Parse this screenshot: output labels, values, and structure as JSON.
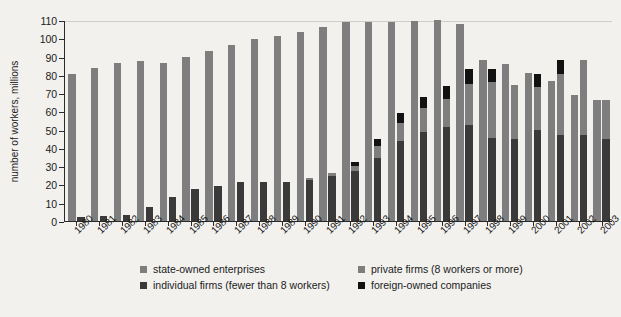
{
  "chart_data": {
    "type": "bar",
    "title": "",
    "xlabel": "",
    "ylabel": "number of workers, millions",
    "ylim": [
      0,
      110
    ],
    "ytick_step": 10,
    "yticks": [
      0,
      10,
      20,
      30,
      40,
      50,
      60,
      70,
      80,
      90,
      100,
      110
    ],
    "grid": false,
    "legend_position": "bottom",
    "stacked": true,
    "grouping": "Each year shows two bars: state-owned enterprises (left) and a stacked bar of individual firms + private firms + foreign-owned companies (right)",
    "categories": [
      "1980",
      "1981",
      "1982",
      "1983",
      "1984",
      "1985",
      "1986",
      "1987",
      "1988",
      "1989",
      "1990",
      "1991",
      "1992",
      "1993",
      "1994",
      "1995",
      "1996",
      "1997",
      "1998",
      "1999",
      "2000",
      "2001",
      "2002",
      "2003"
    ],
    "series": [
      {
        "name": "state-owned enterprises",
        "color": "#7e7e7e",
        "bar": "left",
        "values": [
          80.2,
          83.7,
          86.3,
          87.7,
          86.3,
          89.9,
          93.3,
          96.5,
          99.8,
          101.0,
          103.5,
          106.2,
          108.9,
          108.9,
          108.9,
          109.3,
          109.8,
          107.7,
          88.1,
          85.7,
          81.0,
          76.4,
          69.2,
          66.2
        ]
      },
      {
        "name": "individual firms (fewer than 8 workers)",
        "color": "#3a3a3a",
        "bar": "right",
        "stack_order": 1,
        "values": [
          2.3,
          2.6,
          3.2,
          7.5,
          13.4,
          17.7,
          19.3,
          21.6,
          21.4,
          21.2,
          22.5,
          24.7,
          27.4,
          34.3,
          43.6,
          48.6,
          51.5,
          52.6,
          45.2,
          44.7,
          49.9,
          47.2,
          47.2,
          45.0
        ]
      },
      {
        "name": "private firms (8 workers or more)",
        "color": "#7e7e7e",
        "bar": "right",
        "stack_order": 2,
        "values": [
          0.0,
          0.0,
          0.0,
          0.0,
          0.0,
          0.0,
          0.0,
          0.0,
          0.0,
          0.0,
          1.0,
          1.8,
          2.6,
          6.8,
          10.2,
          13.0,
          15.5,
          22.4,
          30.8,
          30.0,
          23.6,
          33.5,
          41.0,
          21.2
        ]
      },
      {
        "name": "foreign-owned companies",
        "color": "#121212",
        "bar": "right",
        "stack_order": 3,
        "values": [
          0.0,
          0.0,
          0.0,
          0.0,
          0.0,
          0.0,
          0.0,
          0.0,
          0.0,
          0.0,
          0.0,
          0.0,
          2.2,
          3.8,
          5.4,
          6.3,
          6.8,
          8.0,
          7.2,
          0.0,
          7.0,
          7.5,
          0.0,
          0.0
        ]
      }
    ]
  },
  "axis": {
    "y_title": "number of workers, millions"
  },
  "legend": {
    "items": [
      {
        "label": "state-owned enterprises",
        "color": "#7e7e7e"
      },
      {
        "label": "individual firms (fewer than 8 workers)",
        "color": "#3a3a3a"
      },
      {
        "label": "private firms (8 workers or more)",
        "color": "#7e7e7e"
      },
      {
        "label": "foreign-owned companies",
        "color": "#121212"
      }
    ]
  },
  "colors": {
    "background": "#f2f1ee",
    "plot_background": "#f2f1ee",
    "axis": "#2a2a2a",
    "state_owned": "#7e7e7e",
    "individual": "#3a3a3a",
    "private": "#7e7e7e",
    "foreign": "#121212"
  }
}
